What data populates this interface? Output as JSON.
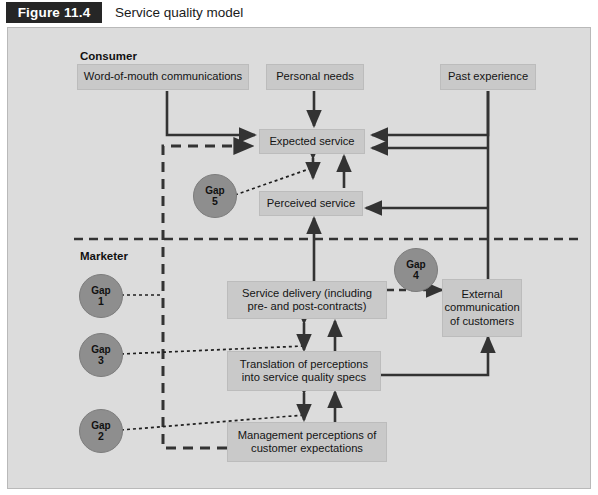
{
  "header": {
    "figure_tag": "Figure 11.4",
    "title": "Service quality model"
  },
  "diagram": {
    "section_labels": {
      "consumer": "Consumer",
      "marketer": "Marketer"
    },
    "nodes": [
      {
        "id": "word-of-mouth",
        "label": "Word-of-mouth communications"
      },
      {
        "id": "personal-needs",
        "label": "Personal needs"
      },
      {
        "id": "past-experience",
        "label": "Past experience"
      },
      {
        "id": "expected-service",
        "label": "Expected service"
      },
      {
        "id": "perceived-service",
        "label": "Perceived service"
      },
      {
        "id": "service-delivery",
        "label": "Service delivery (including pre- and post-contracts)"
      },
      {
        "id": "external-communication",
        "label": "External communication of customers"
      },
      {
        "id": "translation",
        "label": "Translation of perceptions into service quality specs"
      },
      {
        "id": "management-perceptions",
        "label": "Management perceptions of customer expectations"
      }
    ],
    "gaps": [
      {
        "id": "gap-5",
        "label": "Gap",
        "number": "5"
      },
      {
        "id": "gap-1",
        "label": "Gap",
        "number": "1"
      },
      {
        "id": "gap-3",
        "label": "Gap",
        "number": "3"
      },
      {
        "id": "gap-2",
        "label": "Gap",
        "number": "2"
      },
      {
        "id": "gap-4",
        "label": "Gap",
        "number": "4"
      }
    ],
    "colors": {
      "panel_background": "#dcdcdc",
      "node_fill": "#c9c9c9",
      "gap_fill": "#8e8e8e",
      "connector": "#333333",
      "tag_background": "#262626"
    }
  }
}
